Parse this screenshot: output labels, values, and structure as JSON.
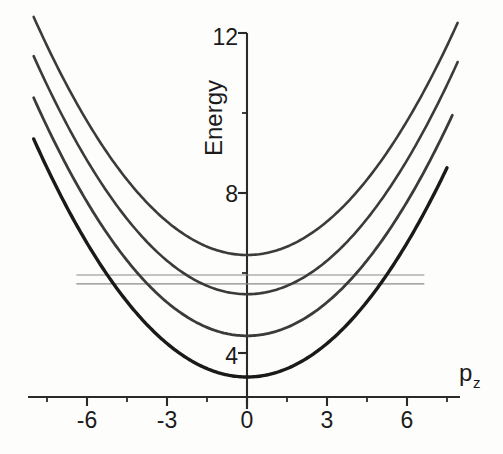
{
  "chart_data": {
    "type": "line",
    "title": "",
    "xlabel": "p_z",
    "ylabel": "Energy",
    "xlim": [
      -8.2,
      8.0
    ],
    "ylim": [
      2.3,
      12.4
    ],
    "grid": false,
    "legend": null,
    "x_ticks_major": [
      -6,
      -3,
      0,
      3,
      6
    ],
    "x_tick_labels": [
      "-6",
      "-3",
      "0",
      "3",
      "6"
    ],
    "x_ticks_minor": [
      -7.5,
      -4.5,
      -1.5,
      1.5,
      4.5,
      7.5
    ],
    "y_ticks_major": [
      4,
      8,
      12
    ],
    "y_tick_labels": [
      "4",
      "8",
      "12"
    ],
    "y_ticks_minor": [
      6,
      10
    ],
    "series": [
      {
        "name": "band-4",
        "vertex_x": 0,
        "vertex_y": 6.45,
        "curvature": 0.093,
        "color": "#3b3b3b",
        "width": 2.6,
        "x_range": [
          -8.0,
          7.9
        ]
      },
      {
        "name": "band-3",
        "vertex_x": 0,
        "vertex_y": 5.47,
        "curvature": 0.093,
        "color": "#3b3b3b",
        "width": 2.6,
        "x_range": [
          -8.0,
          7.9
        ]
      },
      {
        "name": "band-2",
        "vertex_x": 0,
        "vertex_y": 4.43,
        "curvature": 0.093,
        "color": "#3b3b3b",
        "width": 2.8,
        "x_range": [
          -8.0,
          7.7
        ]
      },
      {
        "name": "band-1",
        "vertex_x": 0,
        "vertex_y": 3.4,
        "curvature": 0.093,
        "color": "#1a1a1a",
        "width": 3.4,
        "x_range": [
          -8.0,
          7.5
        ]
      }
    ],
    "hlines": [
      {
        "name": "fermi-level-upper",
        "y": 5.95,
        "x_from": -6.4,
        "x_to": 6.65,
        "color": "#8a8a8a",
        "width": 1.2
      },
      {
        "name": "fermi-level-lower",
        "y": 5.73,
        "x_from": -6.4,
        "x_to": 6.65,
        "color": "#8a8a8a",
        "width": 1.2
      }
    ]
  },
  "labels": {
    "y_axis_title": "Energy",
    "x_axis_title_base": "p",
    "x_axis_title_sub": "z",
    "y_tick_12": "12",
    "y_tick_8": "8",
    "y_tick_4": "4",
    "x_tick_m6": "-6",
    "x_tick_m3": "-3",
    "x_tick_0": "0",
    "x_tick_3": "3",
    "x_tick_6": "6"
  },
  "colors": {
    "background": "#fdfdfc",
    "axis": "#2a2a2a",
    "curve": "#3b3b3b",
    "curve_bold": "#1a1a1a",
    "hline": "#8a8a8a",
    "text": "#1b1b1b"
  }
}
